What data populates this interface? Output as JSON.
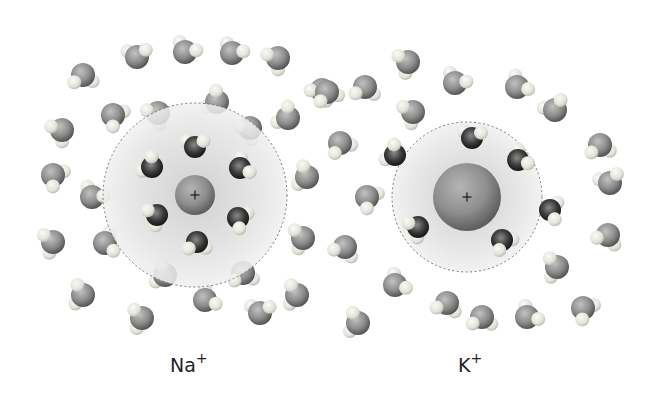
{
  "diagram": {
    "ions": [
      {
        "id": "na",
        "label": "Na",
        "charge": "+",
        "center": [
          195,
          195
        ],
        "ion_radius": 20,
        "shell_radius": 92,
        "label_pos": [
          170,
          352
        ],
        "inner_waters": [
          [
            195,
            147
          ],
          [
            152,
            167
          ],
          [
            240,
            168
          ],
          [
            157,
            215
          ],
          [
            238,
            218
          ],
          [
            197,
            242
          ]
        ]
      },
      {
        "id": "k",
        "label": "K",
        "charge": "+",
        "center": [
          467,
          197
        ],
        "ion_radius": 34,
        "shell_radius": 75,
        "label_pos": [
          458,
          352
        ],
        "inner_waters": [
          [
            472,
            138
          ],
          [
            395,
            155
          ],
          [
            518,
            160
          ],
          [
            550,
            210
          ],
          [
            418,
            227
          ],
          [
            502,
            240
          ]
        ]
      }
    ],
    "bulk_waters": [
      [
        83,
        75
      ],
      [
        137,
        57
      ],
      [
        185,
        52
      ],
      [
        232,
        53
      ],
      [
        278,
        58
      ],
      [
        322,
        90
      ],
      [
        62,
        130
      ],
      [
        113,
        115
      ],
      [
        158,
        113
      ],
      [
        217,
        102
      ],
      [
        250,
        128
      ],
      [
        288,
        118
      ],
      [
        53,
        175
      ],
      [
        92,
        197
      ],
      [
        307,
        177
      ],
      [
        53,
        242
      ],
      [
        105,
        243
      ],
      [
        303,
        238
      ],
      [
        83,
        295
      ],
      [
        165,
        275
      ],
      [
        243,
        273
      ],
      [
        297,
        295
      ],
      [
        142,
        318
      ],
      [
        205,
        300
      ],
      [
        260,
        313
      ],
      [
        327,
        92
      ],
      [
        365,
        87
      ],
      [
        408,
        62
      ],
      [
        455,
        83
      ],
      [
        517,
        87
      ],
      [
        555,
        110
      ],
      [
        413,
        112
      ],
      [
        340,
        143
      ],
      [
        600,
        145
      ],
      [
        610,
        183
      ],
      [
        367,
        197
      ],
      [
        608,
        235
      ],
      [
        345,
        247
      ],
      [
        557,
        267
      ],
      [
        395,
        285
      ],
      [
        447,
        303
      ],
      [
        482,
        317
      ],
      [
        527,
        317
      ],
      [
        583,
        308
      ],
      [
        358,
        323
      ]
    ],
    "colors": {
      "shell_fill": "#d9d9d9",
      "shell_stroke": "#777777",
      "ion": "#8c8c8c",
      "oxygen_bulk": "#8a8a8a",
      "oxygen_inner": "#2a2a2a",
      "hydrogen": "#e6e6e0"
    }
  },
  "labels": {
    "na": {
      "symbol": "Na",
      "charge": "+"
    },
    "k": {
      "symbol": "K",
      "charge": "+"
    }
  }
}
